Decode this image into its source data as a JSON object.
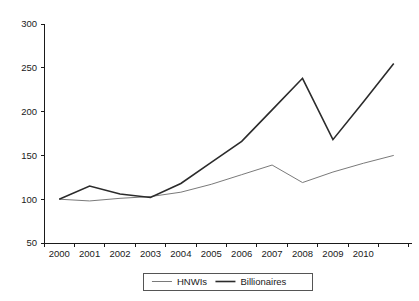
{
  "chart_data": {
    "type": "line",
    "title": "",
    "subtitle": "",
    "xlabel": "",
    "ylabel": "",
    "xlim": [
      1999.5,
      2011.6
    ],
    "ylim": [
      50,
      300
    ],
    "yticks": [
      50,
      100,
      150,
      200,
      250,
      300
    ],
    "ytick_labels": [
      "50",
      "100",
      "150",
      "200",
      "250",
      "300"
    ],
    "x": [
      2000,
      2001,
      2002,
      2003,
      2004,
      2005,
      2006,
      2007,
      2008,
      2009,
      2010,
      2011
    ],
    "xtick_labels": [
      "2000",
      "2001",
      "2002",
      "2003",
      "2004",
      "2005",
      "2006",
      "2007",
      "2008",
      "2009",
      "2010"
    ],
    "grid": false,
    "legend_position": "bottom-center",
    "series": [
      {
        "name": "HNWIs",
        "color": "#7a7a7a",
        "width": 1.0,
        "values": [
          100,
          98,
          101,
          103,
          108,
          117,
          128,
          139,
          119,
          131,
          141,
          150
        ]
      },
      {
        "name": "Billionaires",
        "color": "#2b2b2b",
        "width": 1.6,
        "values": [
          100,
          115,
          106,
          102,
          118,
          142,
          166,
          202,
          238,
          168,
          211,
          255
        ]
      }
    ]
  },
  "legend": {
    "entries": [
      {
        "label": "HNWIs"
      },
      {
        "label": "Billionaires"
      }
    ]
  },
  "axes": {
    "y_axis_name": "index-value-axis",
    "x_axis_name": "year-axis"
  }
}
